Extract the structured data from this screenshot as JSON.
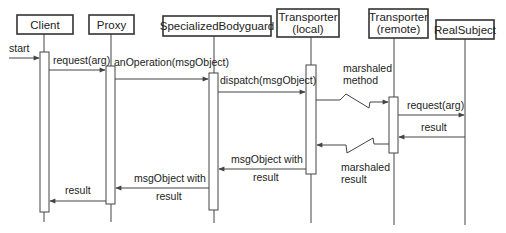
{
  "diagram": {
    "type": "sequence",
    "colors": {
      "line": "#444444",
      "text": "#222222",
      "background": "#ffffff",
      "box_fill": "#ffffff"
    },
    "participants": [
      {
        "id": "client",
        "label_lines": [
          "Client"
        ],
        "box": [
          17,
          15,
          56,
          19
        ],
        "lifeline_x": 44,
        "lifeline_end": 222
      },
      {
        "id": "proxy",
        "label_lines": [
          "Proxy"
        ],
        "box": [
          89,
          15,
          45,
          19
        ],
        "lifeline_x": 111,
        "lifeline_end": 222
      },
      {
        "id": "bodyguard",
        "label_lines": [
          "SpecializedBodyguard"
        ],
        "box": [
          163,
          16,
          108,
          20
        ],
        "lifeline_x": 214,
        "lifeline_end": 223
      },
      {
        "id": "transporter-local",
        "label_lines": [
          "Transporter",
          "(local)"
        ],
        "box": [
          277,
          9,
          62,
          28
        ],
        "lifeline_x": 311,
        "lifeline_end": 223
      },
      {
        "id": "transporter-remote",
        "label_lines": [
          "Transporter",
          "(remote)"
        ],
        "box": [
          369,
          9,
          59,
          29
        ],
        "lifeline_x": 394,
        "lifeline_end": 225
      },
      {
        "id": "realsubject",
        "label_lines": [
          "RealSubject"
        ],
        "box": [
          436,
          20,
          58,
          19
        ],
        "lifeline_x": 465,
        "lifeline_end": 225
      }
    ],
    "activations": [
      {
        "participant": "client",
        "x": 40,
        "y": 52,
        "w": 9,
        "h": 160
      },
      {
        "participant": "proxy",
        "x": 106,
        "y": 66,
        "w": 9,
        "h": 138
      },
      {
        "participant": "bodyguard",
        "x": 209,
        "y": 73,
        "w": 9,
        "h": 137
      },
      {
        "participant": "transporter-local",
        "x": 306,
        "y": 65,
        "w": 10,
        "h": 109
      },
      {
        "participant": "transporter-remote",
        "x": 389,
        "y": 97,
        "w": 9,
        "h": 56
      }
    ],
    "messages": [
      {
        "id": "start",
        "label_lines": [
          "start"
        ],
        "type": "call",
        "from_x": 9,
        "to_x": 39,
        "y": 58,
        "label_x": 9,
        "label_y": 52
      },
      {
        "id": "request-arg-1",
        "label_lines": [
          "request(arg)"
        ],
        "type": "call",
        "from_x": 49,
        "to_x": 105,
        "y": 70,
        "label_x": 53,
        "label_y": 64
      },
      {
        "id": "an-operation",
        "label_lines": [
          "anOperation(msgObject)"
        ],
        "type": "call",
        "from_x": 115,
        "to_x": 208,
        "y": 79,
        "label_x": 114,
        "label_y": 66
      },
      {
        "id": "dispatch",
        "label_lines": [
          "dispatch(msgObject)"
        ],
        "type": "call",
        "from_x": 218,
        "to_x": 305,
        "y": 92,
        "label_x": 220,
        "label_y": 84
      },
      {
        "id": "marshaled-method",
        "label_lines": [
          "marshaled",
          "method"
        ],
        "type": "network-call",
        "from_x": 316,
        "to_x": 388,
        "y": 100,
        "label_x": 343,
        "label_y": 72
      },
      {
        "id": "request-arg-2",
        "label_lines": [
          "request(arg)"
        ],
        "type": "call",
        "from_x": 398,
        "to_x": 464,
        "y": 115,
        "label_x": 407,
        "label_y": 109
      },
      {
        "id": "result-1",
        "label_lines": [
          "result"
        ],
        "type": "return",
        "from_x": 465,
        "to_x": 399,
        "y": 137,
        "label_x": 421,
        "label_y": 131
      },
      {
        "id": "marshaled-result",
        "label_lines": [
          "marshaled",
          "result"
        ],
        "type": "network-return",
        "from_x": 389,
        "to_x": 317,
        "y": 144,
        "label_x": 341,
        "label_y": 171
      },
      {
        "id": "msg-object-with-result-1",
        "label_lines": [
          "msgObject with",
          "result"
        ],
        "type": "return",
        "from_x": 306,
        "to_x": 219,
        "y": 169,
        "label_x": 231,
        "label_y": 163
      },
      {
        "id": "msg-object-with-result-2",
        "label_lines": [
          "msgObject with",
          "result"
        ],
        "type": "return",
        "from_x": 209,
        "to_x": 116,
        "y": 188,
        "label_x": 134,
        "label_y": 182
      },
      {
        "id": "result-2",
        "label_lines": [
          "result"
        ],
        "type": "return",
        "from_x": 106,
        "to_x": 50,
        "y": 201,
        "label_x": 65,
        "label_y": 194
      }
    ]
  }
}
